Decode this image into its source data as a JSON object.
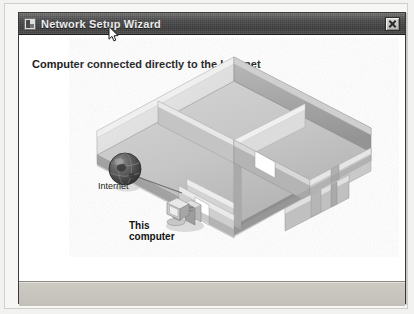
{
  "window": {
    "title": "Network Setup Wizard",
    "app_icon": "wizard-icon",
    "close_label": "✕"
  },
  "content": {
    "heading": "Computer connected directly to the Internet"
  },
  "diagram": {
    "type": "isometric-floorplan",
    "internet_label": "Internet",
    "computer_label_line1": "This",
    "computer_label_line2": "computer",
    "nodes": [
      {
        "name": "internet-globe",
        "label": "Internet"
      },
      {
        "name": "this-computer",
        "label": "This computer"
      }
    ],
    "connection": "internet-globe → this-computer"
  },
  "colors": {
    "titlebar": "#4a4a4a",
    "title_text": "#ececec",
    "client_bg": "#ffffff",
    "bottom_panel": "#c6c3bc",
    "window_border": "#3a3a3a",
    "heading_text": "#1b1b1b",
    "globe": "#4b4b4b",
    "floor": "#c9c9c9",
    "wall_light": "#d8d8d8",
    "wall_dark": "#a9a9a9"
  }
}
